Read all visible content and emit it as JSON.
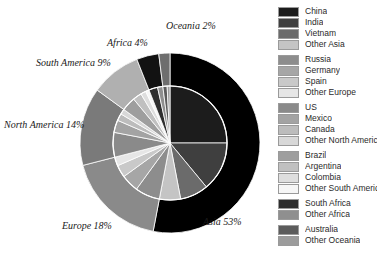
{
  "chart_data": {
    "type": "pie",
    "title": "",
    "variant": "nested-donut",
    "layout": {
      "center_x": 170,
      "center_y": 143,
      "outer_radius": 90,
      "inner_radius": 57,
      "start_angle_deg": -90,
      "direction": "clockwise",
      "legend_position": "right"
    },
    "outer_ring": {
      "name": "Continent",
      "categories": [
        "Asia",
        "Europe",
        "North America",
        "South America",
        "Africa",
        "Oceania"
      ],
      "values": [
        53,
        18,
        14,
        9,
        4,
        2
      ],
      "labels": [
        "Asia 53%",
        "Europe 18%",
        "North America 14%",
        "South America 9%",
        "Africa 4%",
        "Oceania 2%"
      ],
      "colors": [
        "#000000",
        "#8a8a8a",
        "#7a7a7a",
        "#b0b0b0",
        "#121212",
        "#6e6e6e"
      ]
    },
    "inner_pie": {
      "name": "Country",
      "categories": [
        "China",
        "India",
        "Vietnam",
        "Other Asia",
        "Russia",
        "Germany",
        "Spain",
        "Other Europe",
        "US",
        "Mexico",
        "Canada",
        "Other North America",
        "Brazil",
        "Argentina",
        "Colombia",
        "Other South America",
        "South Africa",
        "Other Africa",
        "Australia",
        "Other Oceania"
      ],
      "values": [
        25,
        14,
        8,
        6,
        7,
        5,
        3.5,
        2.5,
        7,
        3.5,
        2,
        1.5,
        4,
        2.5,
        1.5,
        1,
        2.5,
        1.5,
        1.2,
        0.8
      ],
      "colors": [
        "#1c1c1c",
        "#3f3f3f",
        "#6b6b6b",
        "#c4c4c4",
        "#8d8d8d",
        "#a6a6a6",
        "#c9c9c9",
        "#e6e6e6",
        "#8a8a8a",
        "#a3a3a3",
        "#bcbcbc",
        "#d8d8d8",
        "#9e9e9e",
        "#c0c0c0",
        "#dedede",
        "#f6f6f6",
        "#2e2e2e",
        "#8f8f8f",
        "#5c5c5c",
        "#9c9c9c"
      ]
    },
    "slice_stroke": "#ffffff"
  },
  "labels": {
    "asia": "Asia 53%",
    "europe": "Europe 18%",
    "north_america": "North America 14%",
    "south_america": "South America 9%",
    "africa": "Africa 4%",
    "oceania": "Oceania 2%"
  },
  "legend": {
    "groups": [
      {
        "name": "asia",
        "items": [
          {
            "label": "China",
            "color": "#1c1c1c"
          },
          {
            "label": "India",
            "color": "#3f3f3f"
          },
          {
            "label": "Vietnam",
            "color": "#6b6b6b"
          },
          {
            "label": "Other Asia",
            "color": "#c4c4c4"
          }
        ]
      },
      {
        "name": "europe",
        "items": [
          {
            "label": "Russia",
            "color": "#8d8d8d"
          },
          {
            "label": "Germany",
            "color": "#a6a6a6"
          },
          {
            "label": "Spain",
            "color": "#c9c9c9"
          },
          {
            "label": "Other Europe",
            "color": "#e6e6e6"
          }
        ]
      },
      {
        "name": "north-america",
        "items": [
          {
            "label": "US",
            "color": "#8a8a8a"
          },
          {
            "label": "Mexico",
            "color": "#a3a3a3"
          },
          {
            "label": "Canada",
            "color": "#bcbcbc"
          },
          {
            "label": "Other North America",
            "color": "#d8d8d8"
          }
        ]
      },
      {
        "name": "south-america",
        "items": [
          {
            "label": "Brazil",
            "color": "#9e9e9e"
          },
          {
            "label": "Argentina",
            "color": "#c0c0c0"
          },
          {
            "label": "Colombia",
            "color": "#dedede"
          },
          {
            "label": "Other South America",
            "color": "#f6f6f6"
          }
        ]
      },
      {
        "name": "africa",
        "items": [
          {
            "label": "South Africa",
            "color": "#2e2e2e"
          },
          {
            "label": "Other Africa",
            "color": "#8f8f8f"
          }
        ]
      },
      {
        "name": "oceania",
        "items": [
          {
            "label": "Australia",
            "color": "#5c5c5c"
          },
          {
            "label": "Other Oceania",
            "color": "#9c9c9c"
          }
        ]
      }
    ]
  }
}
